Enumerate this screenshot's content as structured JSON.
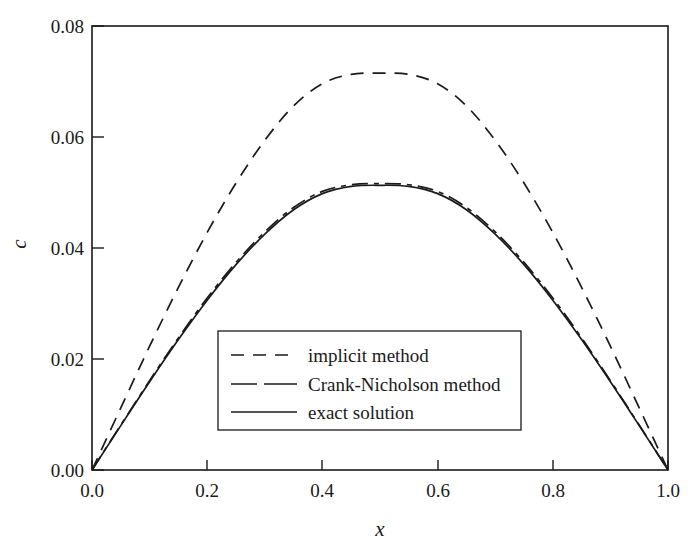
{
  "chart_data": {
    "type": "line",
    "title": "",
    "xlabel": "x",
    "ylabel": "c",
    "xlim": [
      0.0,
      1.0
    ],
    "ylim": [
      0.0,
      0.08
    ],
    "grid": false,
    "legend_position": "center-lower",
    "xticks": [
      "0.0",
      "0.2",
      "0.4",
      "0.6",
      "0.8",
      "1.0"
    ],
    "xtick_values": [
      0.0,
      0.2,
      0.4,
      0.6,
      0.8,
      1.0
    ],
    "yticks": [
      "0.00",
      "0.02",
      "0.04",
      "0.06",
      "0.08"
    ],
    "ytick_values": [
      0.0,
      0.02,
      0.04,
      0.06,
      0.08
    ],
    "x": [
      0.0,
      0.05,
      0.1,
      0.15,
      0.2,
      0.25,
      0.3,
      0.35,
      0.4,
      0.45,
      0.5,
      0.55,
      0.6,
      0.65,
      0.7,
      0.75,
      0.8,
      0.85,
      0.9,
      0.95,
      1.0
    ],
    "series": [
      {
        "name": "implicit method",
        "style": "dashed",
        "color": "#1a1a1a",
        "values": [
          0.0,
          0.0112,
          0.0223,
          0.0329,
          0.0428,
          0.0517,
          0.0594,
          0.0656,
          0.0696,
          0.0713,
          0.0715,
          0.0713,
          0.0696,
          0.0656,
          0.0594,
          0.0517,
          0.0428,
          0.0329,
          0.0223,
          0.0112,
          0.0
        ]
      },
      {
        "name": "Crank-Nicholson method",
        "style": "dash-dot",
        "color": "#1a1a1a",
        "values": [
          0.0,
          0.0081,
          0.0161,
          0.0238,
          0.031,
          0.0374,
          0.0429,
          0.0473,
          0.0502,
          0.0514,
          0.0516,
          0.0514,
          0.0502,
          0.0473,
          0.0429,
          0.0374,
          0.031,
          0.0238,
          0.0161,
          0.0081,
          0.0
        ]
      },
      {
        "name": "exact solution",
        "style": "solid",
        "color": "#1a1a1a",
        "values": [
          0.0,
          0.008,
          0.0159,
          0.0235,
          0.0306,
          0.037,
          0.0425,
          0.0469,
          0.0498,
          0.0511,
          0.0513,
          0.0511,
          0.0498,
          0.0469,
          0.0425,
          0.037,
          0.0306,
          0.0235,
          0.0159,
          0.008,
          0.0
        ]
      }
    ]
  },
  "legend": {
    "entries": [
      {
        "label": "implicit method",
        "style": "dashed"
      },
      {
        "label": "Crank-Nicholson method",
        "style": "dash-dot"
      },
      {
        "label": "exact solution",
        "style": "solid"
      }
    ]
  },
  "axes": {
    "x_title": "x",
    "y_title": "c"
  }
}
